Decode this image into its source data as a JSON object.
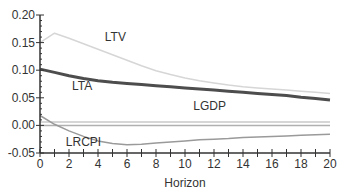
{
  "chart_data": {
    "type": "line",
    "title": "",
    "xlabel": "Horizon",
    "ylabel": "",
    "xlim": [
      0,
      20
    ],
    "ylim": [
      -0.05,
      0.2
    ],
    "x_ticks": [
      0,
      2,
      4,
      6,
      8,
      10,
      12,
      14,
      16,
      18,
      20
    ],
    "y_ticks": [
      -0.05,
      0.0,
      0.05,
      0.1,
      0.15,
      0.2
    ],
    "y_tick_labels": [
      "-0.05",
      "0.00",
      "0.05",
      "0.10",
      "0.15",
      "0.20"
    ],
    "x_tick_labels": [
      "0",
      "2",
      "4",
      "6",
      "8",
      "10",
      "12",
      "14",
      "16",
      "18",
      "20"
    ],
    "grid": false,
    "legend": "inline labels",
    "x": [
      0,
      1,
      2,
      3,
      4,
      5,
      6,
      7,
      8,
      9,
      10,
      11,
      12,
      13,
      14,
      15,
      16,
      17,
      18,
      19,
      20
    ],
    "series": [
      {
        "name": "LTV",
        "color": "#d6d6d6",
        "width": 1.5,
        "values": [
          0.15,
          0.167,
          0.158,
          0.148,
          0.138,
          0.128,
          0.118,
          0.108,
          0.099,
          0.092,
          0.086,
          0.081,
          0.077,
          0.073,
          0.07,
          0.068,
          0.066,
          0.064,
          0.062,
          0.06,
          0.058
        ],
        "label_pos": {
          "x": 5.2,
          "y": 0.153
        }
      },
      {
        "name": "LTA",
        "color": "#4d4d4d",
        "width": 3,
        "values": [
          0.102,
          0.096,
          0.09,
          0.085,
          0.081,
          0.078,
          0.076,
          0.074,
          0.072,
          0.07,
          0.068,
          0.066,
          0.064,
          0.062,
          0.06,
          0.058,
          0.056,
          0.054,
          0.051,
          0.049,
          0.046
        ],
        "label_pos": {
          "x": 2.9,
          "y": 0.065
        }
      },
      {
        "name": "LGDP",
        "color": "#c8c8c8",
        "width": 1.5,
        "values": [
          0.006,
          0.006,
          0.006,
          0.006,
          0.006,
          0.006,
          0.006,
          0.006,
          0.006,
          0.006,
          0.006,
          0.006,
          0.006,
          0.006,
          0.006,
          0.006,
          0.006,
          0.006,
          0.006,
          0.006,
          0.006
        ],
        "label_pos": {
          "x": 11.7,
          "y": 0.028
        }
      },
      {
        "name": "zero",
        "color": "#b0b0b0",
        "width": 1.5,
        "values": [
          0.0,
          0.0,
          0.0,
          0.0,
          0.0,
          0.0,
          0.0,
          0.0,
          0.0,
          0.0,
          0.0,
          0.0,
          0.0,
          0.0,
          0.0,
          0.0,
          0.0,
          0.0,
          0.0,
          0.0,
          0.0
        ]
      },
      {
        "name": "LRCPI",
        "color": "#9a9a9a",
        "width": 1.5,
        "values": [
          0.018,
          0.002,
          -0.01,
          -0.02,
          -0.028,
          -0.033,
          -0.035,
          -0.034,
          -0.032,
          -0.03,
          -0.028,
          -0.026,
          -0.025,
          -0.024,
          -0.022,
          -0.021,
          -0.02,
          -0.019,
          -0.018,
          -0.017,
          -0.016
        ],
        "label_pos": {
          "x": 3.0,
          "y": -0.038
        }
      }
    ]
  }
}
